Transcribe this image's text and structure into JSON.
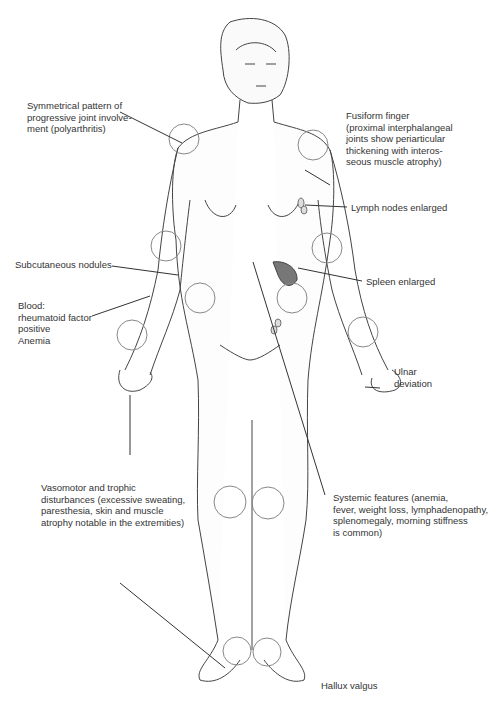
{
  "labels": {
    "polyarthritis": "Symmetrical pattern of\nprogressive joint involve-\nment (polyarthritis)",
    "fusiform": "Fusiform finger\n(proximal interphalangeal\njoints show periarticular\nthickening with interos-\nseous muscle atrophy)",
    "lymph": "Lymph nodes enlarged",
    "subcutaneous": "Subcutaneous nodules",
    "spleen": "Spleen enlarged",
    "blood": "Blood:\nrheumatoid factor\npositive\nAnemia",
    "ulnar": "Ulnar\ndeviation",
    "vasomotor": "Vasomotor and trophic\ndisturbances (excessive sweating,\nparesthesia, skin and muscle\natrophy notable in the extremities)",
    "systemic": "Systemic features (anemia,\nfever, weight loss, lymphadenopathy,\nsplenomegaly, morning stiffness\nis common)",
    "hallux": "Hallux valgus"
  },
  "colors": {
    "line": "#3a3a3a",
    "joint_circle": "#888888",
    "spleen": "#6e6e6e"
  }
}
